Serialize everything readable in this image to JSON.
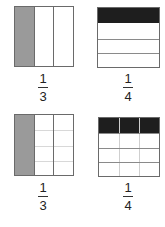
{
  "figures": [
    {
      "id": "top-left",
      "model": "vertical-strips",
      "divisions": 3,
      "shaded": 1,
      "shade_color": "#9a9a9a",
      "fraction": {
        "numerator": "1",
        "denominator": "3"
      }
    },
    {
      "id": "top-right",
      "model": "horizontal-strips",
      "divisions": 4,
      "shaded": 1,
      "shade_color": "#1e1e1e",
      "fraction": {
        "numerator": "1",
        "denominator": "4"
      }
    },
    {
      "id": "bottom-left",
      "model": "grid",
      "columns": 3,
      "rows": 4,
      "shaded_columns": 1,
      "shade_color": "#9a9a9a",
      "fraction": {
        "numerator": "1",
        "denominator": "3"
      }
    },
    {
      "id": "bottom-right",
      "model": "grid",
      "columns": 3,
      "rows": 4,
      "shaded_rows": 1,
      "shade_color": "#1e1e1e",
      "fraction": {
        "numerator": "1",
        "denominator": "4"
      }
    }
  ]
}
